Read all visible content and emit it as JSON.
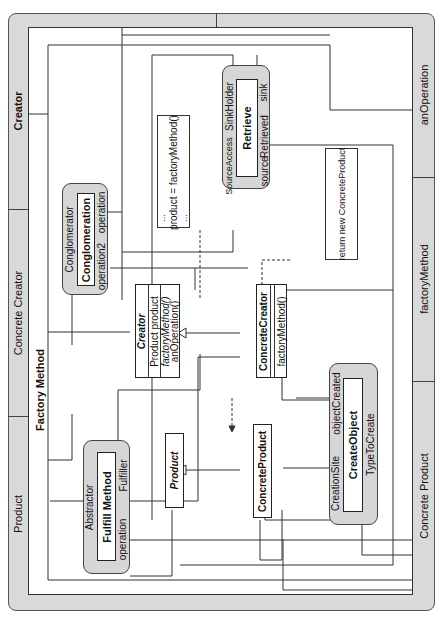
{
  "title": "Factory Method",
  "frame": {
    "left_labels": [
      "Creator",
      "Concrete Creator",
      "Product"
    ],
    "right_labels": [
      "anOperation",
      "factoryMethod",
      "Concrete Product"
    ]
  },
  "classes": {
    "creator": {
      "name": "Creator",
      "attributes": [
        "Product product"
      ],
      "operations": [
        "factoryMethod()",
        "anOperation()"
      ]
    },
    "concrete_creator": {
      "name": "ConcreteCreator",
      "operations": [
        "factoryMethod()"
      ]
    },
    "product": {
      "name": "Product"
    },
    "concrete_product": {
      "name": "ConcreteProduct"
    }
  },
  "collaborations": {
    "retrieve": {
      "name": "Retrieve",
      "roles": [
        "SinkHolder",
        "SourceAccess",
        "sink",
        "Retrieved",
        "source"
      ]
    },
    "conglomeration": {
      "name": "Conglomeration",
      "roles": [
        "Conglomerator",
        "operation",
        "operation2"
      ]
    },
    "fulfill_method": {
      "name": "Fulfill Method",
      "roles": [
        "Abstractor",
        "Fulfiller",
        "operation"
      ]
    },
    "create_object": {
      "name": "CreateObject",
      "roles": [
        "objectCreated",
        "CreationSite",
        "TypeToCreate"
      ]
    }
  },
  "notes": {
    "creator_note": {
      "line1": "...",
      "line2": "product = factoryMethod()",
      "line3": "..."
    },
    "concrete_note": {
      "text": "return new ConcreteProduct"
    }
  },
  "colors": {
    "frame_fill": "#d9d9d9",
    "collab_fill": "#d6d6d6",
    "line": "#333333"
  }
}
